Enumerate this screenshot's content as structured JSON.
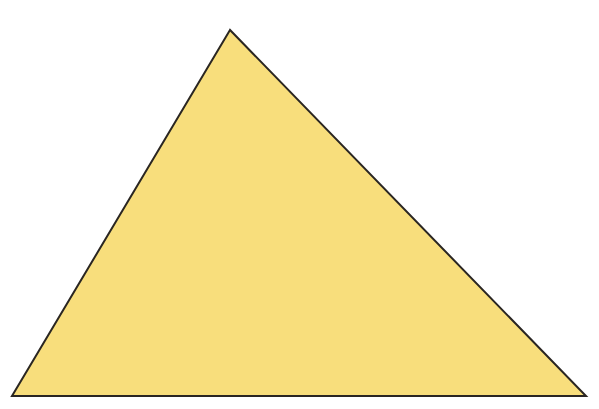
{
  "diagram": {
    "shape": "triangle",
    "vertices": {
      "apex": [
        230,
        30
      ],
      "bottom_left": [
        12,
        396
      ],
      "bottom_right": [
        586,
        396
      ]
    },
    "fill_color": "#F8DE7C",
    "stroke_color": "#2a2622",
    "stroke_width": 2,
    "background_color": "#ffffff"
  }
}
